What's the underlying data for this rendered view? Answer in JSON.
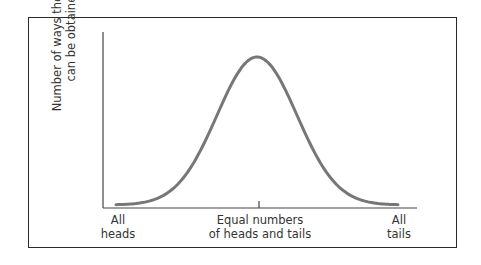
{
  "chart_data": {
    "type": "line",
    "title": "",
    "xlabel": "",
    "ylabel": "Number of ways the result can be obtained",
    "ylabel_lines": [
      "Number of ways the result",
      "can be obtained"
    ],
    "x_tick_labels": [
      {
        "lines": [
          "All",
          "heads"
        ],
        "position": 0
      },
      {
        "lines": [
          "Equal numbers",
          "of heads and tails"
        ],
        "position": 0.5
      },
      {
        "lines": [
          "All",
          "tails"
        ],
        "position": 1
      }
    ],
    "curve": "bell-shaped (normal distribution), symmetric, peaking at equal numbers of heads and tails",
    "x": [
      0,
      0.1,
      0.2,
      0.3,
      0.4,
      0.5,
      0.6,
      0.7,
      0.8,
      0.9,
      1.0
    ],
    "values": [
      0.02,
      0.06,
      0.17,
      0.4,
      0.78,
      1.0,
      0.78,
      0.4,
      0.17,
      0.06,
      0.02
    ],
    "grid": false,
    "legend": "none",
    "colors": {
      "curve": "#777777",
      "axes": "#444444",
      "frame": "#2a2a2a"
    }
  }
}
